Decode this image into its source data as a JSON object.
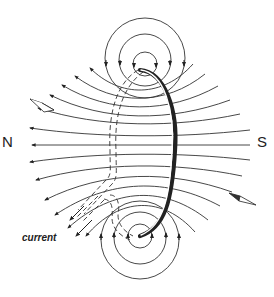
{
  "figure": {
    "labels": {
      "north": "N",
      "south": "S",
      "current": "current"
    },
    "elements": {
      "loop": "wire-loop",
      "field_lines": "magnetic-field-lines",
      "compass_left": "compass-needle-upper-left",
      "compass_right": "compass-needle-lower-right"
    }
  }
}
